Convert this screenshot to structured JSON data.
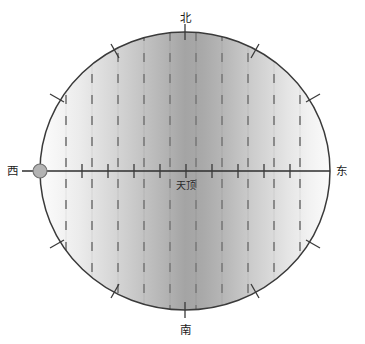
{
  "figure": {
    "type": "celestial-sphere-projection",
    "background_color": "#ffffff",
    "outline_color": "#3a3a3a",
    "center_label": "天顶",
    "labels": {
      "north": "北",
      "south": "南",
      "east": "东",
      "west": "西"
    },
    "marker": {
      "name": "west-point-marker",
      "fill": "#b0b0b0",
      "stroke": "#6e6e6e",
      "cx": 40,
      "cy": 171,
      "r": 7
    },
    "circle": {
      "cx": 185,
      "cy": 171,
      "rx": 145,
      "ry": 139
    },
    "axis": {
      "name": "east-west-axis",
      "color": "#2e2e2e",
      "x1": 22,
      "x2": 330,
      "y": 171
    },
    "rim_ticks": [
      {
        "angle_deg": 90
      },
      {
        "angle_deg": 60
      },
      {
        "angle_deg": 120
      },
      {
        "angle_deg": 30
      },
      {
        "angle_deg": 150
      },
      {
        "angle_deg": 210
      },
      {
        "angle_deg": 330
      },
      {
        "angle_deg": 240
      },
      {
        "angle_deg": 300
      },
      {
        "angle_deg": 270
      }
    ],
    "axis_ticks_x": [
      82,
      108,
      134,
      160,
      186,
      212,
      238,
      264,
      290
    ],
    "bands": [
      {
        "x": 40,
        "w": 26,
        "gray": "#fafafa"
      },
      {
        "x": 66,
        "w": 26,
        "gray": "#f0f0f0"
      },
      {
        "x": 92,
        "w": 26,
        "gray": "#e2e2e2"
      },
      {
        "x": 118,
        "w": 26,
        "gray": "#d2d2d2"
      },
      {
        "x": 144,
        "w": 26,
        "gray": "#bdbdbd"
      },
      {
        "x": 170,
        "w": 26,
        "gray": "#a8a8a8"
      },
      {
        "x": 196,
        "w": 26,
        "gray": "#b5b5b5"
      },
      {
        "x": 222,
        "w": 26,
        "gray": "#c8c8c8"
      },
      {
        "x": 248,
        "w": 26,
        "gray": "#dcdcdc"
      },
      {
        "x": 274,
        "w": 26,
        "gray": "#ececec"
      },
      {
        "x": 300,
        "w": 30,
        "gray": "#f8f8f8"
      }
    ],
    "meridian_lines": {
      "color": "#7a7a7a",
      "dash": "8 11",
      "x_positions": [
        66,
        92,
        118,
        144,
        170,
        196,
        222,
        248,
        274,
        300
      ]
    }
  }
}
